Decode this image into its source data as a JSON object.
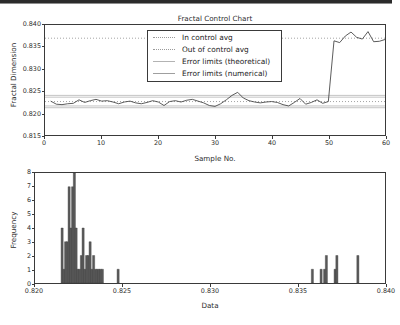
{
  "chart_data": [
    {
      "type": "line",
      "name": "fractal-control-chart",
      "title": "Fractal Control Chart",
      "xlabel": "Sample No.",
      "ylabel": "Fractal Dimension",
      "xlim": [
        0,
        60
      ],
      "ylim": [
        0.815,
        0.84
      ],
      "xticks": [
        0,
        10,
        20,
        30,
        40,
        50,
        60
      ],
      "xticklabels": [
        "0",
        "10",
        "20",
        "30",
        "40",
        "50",
        "60"
      ],
      "yticks": [
        0.815,
        0.82,
        0.825,
        0.83,
        0.835,
        0.84
      ],
      "yticklabels": [
        "0.815",
        "0.820",
        "0.825",
        "0.830",
        "0.835",
        "0.840"
      ],
      "grid": false,
      "legend_position": "upper center",
      "legend": [
        {
          "label": "In control avg",
          "style": "dotted",
          "color": "#9a9a9a"
        },
        {
          "label": "Out of control avg",
          "style": "dotted",
          "color": "#9a9a9a"
        },
        {
          "label": "Error limits (theoretical)",
          "style": "solid",
          "color": "#b3b3b3"
        },
        {
          "label": "Error limits (numerical)",
          "style": "solid",
          "color": "#9f9f9f"
        }
      ],
      "reference_lines": [
        {
          "name": "in-control-avg",
          "value": 0.8226,
          "style": "dotted"
        },
        {
          "name": "out-of-control-avg",
          "value": 0.837,
          "style": "dotted"
        },
        {
          "name": "error-limit-theoretical-upper",
          "value": 0.824,
          "style": "solid"
        },
        {
          "name": "error-limit-theoretical-lower",
          "value": 0.8212,
          "style": "solid"
        },
        {
          "name": "error-limit-numerical-upper",
          "value": 0.8236,
          "style": "solid"
        },
        {
          "name": "error-limit-numerical-lower",
          "value": 0.8216,
          "style": "solid"
        }
      ],
      "x": [
        1,
        2,
        3,
        4,
        5,
        6,
        7,
        8,
        9,
        10,
        11,
        12,
        13,
        14,
        15,
        16,
        17,
        18,
        19,
        20,
        21,
        22,
        23,
        24,
        25,
        26,
        27,
        28,
        29,
        30,
        31,
        32,
        33,
        34,
        35,
        36,
        37,
        38,
        39,
        40,
        41,
        42,
        43,
        44,
        45,
        46,
        47,
        48,
        49,
        50,
        51,
        52,
        53,
        54,
        55,
        56,
        57,
        58,
        59,
        60
      ],
      "values": [
        0.8227,
        0.822,
        0.8219,
        0.8221,
        0.8222,
        0.823,
        0.8224,
        0.8228,
        0.8231,
        0.8227,
        0.8228,
        0.8225,
        0.8221,
        0.8225,
        0.8227,
        0.8223,
        0.8221,
        0.8224,
        0.8228,
        0.8225,
        0.8217,
        0.8226,
        0.8228,
        0.8225,
        0.8229,
        0.8231,
        0.8227,
        0.8223,
        0.8217,
        0.8215,
        0.8221,
        0.823,
        0.824,
        0.8247,
        0.8234,
        0.8228,
        0.8225,
        0.8223,
        0.8225,
        0.8226,
        0.8224,
        0.8219,
        0.8216,
        0.8224,
        0.8233,
        0.822,
        0.8224,
        0.823,
        0.8222,
        0.8226,
        0.8364,
        0.836,
        0.8375,
        0.8384,
        0.8372,
        0.8368,
        0.8385,
        0.8362,
        0.8363,
        0.8367
      ]
    },
    {
      "type": "bar",
      "name": "fractal-histogram",
      "title": "",
      "xlabel": "Data",
      "ylabel": "Frequency",
      "xlim": [
        0.82,
        0.84
      ],
      "ylim": [
        0,
        8
      ],
      "xticks": [
        0.82,
        0.825,
        0.83,
        0.835,
        0.84
      ],
      "xticklabels": [
        "0.820",
        "0.825",
        "0.830",
        "0.835",
        "0.840"
      ],
      "yticks": [
        0,
        1,
        2,
        3,
        4,
        5,
        6,
        7,
        8
      ],
      "yticklabels": [
        "0",
        "1",
        "2",
        "3",
        "4",
        "5",
        "6",
        "7",
        "8"
      ],
      "grid": false,
      "bar_color": "#5a5a5a",
      "bin_width": 0.00012,
      "categories": [
        0.82155,
        0.82165,
        0.82175,
        0.82185,
        0.82195,
        0.82205,
        0.82215,
        0.82225,
        0.82235,
        0.82245,
        0.82255,
        0.82265,
        0.82275,
        0.82285,
        0.82295,
        0.82305,
        0.82315,
        0.82325,
        0.82335,
        0.82345,
        0.82355,
        0.82365,
        0.82375,
        0.82385,
        0.82475,
        0.83585,
        0.83635,
        0.83655,
        0.83665,
        0.83715,
        0.83725,
        0.83845
      ],
      "values": [
        4,
        1,
        3,
        3,
        7,
        4,
        7,
        8,
        4,
        1,
        1,
        2,
        4,
        1,
        2,
        2,
        3,
        1,
        2,
        1,
        1,
        1,
        1,
        1,
        1,
        1,
        1,
        1,
        2,
        1,
        2,
        2
      ]
    }
  ]
}
